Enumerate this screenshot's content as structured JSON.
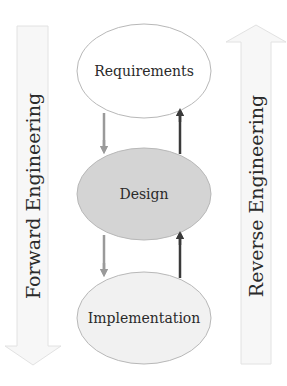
{
  "diagram": {
    "nodes": [
      {
        "id": "requirements",
        "label": "Requirements",
        "fill": "#ffffff"
      },
      {
        "id": "design",
        "label": "Design",
        "fill": "#d4d4d4"
      },
      {
        "id": "implementation",
        "label": "Implementation",
        "fill": "#f1f1f1"
      }
    ],
    "edges": [
      {
        "from": "requirements",
        "to": "design",
        "direction": "down",
        "color": "#9a9a9a"
      },
      {
        "from": "design",
        "to": "requirements",
        "direction": "up",
        "color": "#3a3a3a"
      },
      {
        "from": "design",
        "to": "implementation",
        "direction": "down",
        "color": "#9a9a9a"
      },
      {
        "from": "implementation",
        "to": "design",
        "direction": "up",
        "color": "#3a3a3a"
      }
    ],
    "side_arrows": {
      "left": {
        "label": "Forward Engineering",
        "direction": "down"
      },
      "right": {
        "label": "Reverse Engineering",
        "direction": "up"
      }
    },
    "colors": {
      "node_stroke": "#b8b8b8",
      "side_arrow_fill": "#f7f7f7",
      "side_arrow_stroke": "#e2e2e2",
      "text": "#2a2a2a"
    }
  }
}
